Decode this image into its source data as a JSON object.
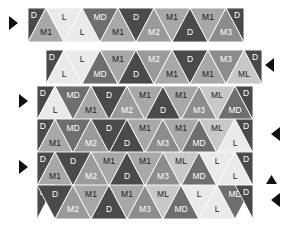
{
  "figure": {
    "type": "triangular-tiling-diagram",
    "rows": 6,
    "palette": {
      "D": "#4a4a4a",
      "MD": "#6e6e6e",
      "M1": "#a8a8a8",
      "M2": "#9a9a9a",
      "M3": "#8c8c8c",
      "ML": "#c8c8c8",
      "L": "#eaeaea"
    },
    "label_dark_on": [
      "D",
      "MD",
      "M3",
      "M2"
    ],
    "marker_color": "#111111"
  },
  "rows": [
    {
      "id": "row-1",
      "x": 28,
      "y": 8,
      "tri_w": 36,
      "tri_h": 34,
      "lead_half": "D",
      "tail_half": "D",
      "tiles": [
        {
          "label": "M1",
          "shade": "M1",
          "dir": "up"
        },
        {
          "label": "L",
          "shade": "L",
          "dir": "down"
        },
        {
          "label": "L",
          "shade": "L",
          "dir": "up"
        },
        {
          "label": "MD",
          "shade": "MD",
          "dir": "down"
        },
        {
          "label": "M1",
          "shade": "M1",
          "dir": "up"
        },
        {
          "label": "D",
          "shade": "D",
          "dir": "down"
        },
        {
          "label": "M2",
          "shade": "M2",
          "dir": "up"
        },
        {
          "label": "M1",
          "shade": "M1",
          "dir": "down"
        },
        {
          "label": "D",
          "shade": "D",
          "dir": "up"
        },
        {
          "label": "M1",
          "shade": "M1",
          "dir": "down"
        },
        {
          "label": "M3",
          "shade": "M3",
          "dir": "up"
        }
      ]
    },
    {
      "id": "row-2",
      "x": 46,
      "y": 50,
      "tri_w": 36,
      "tri_h": 34,
      "lead_half": "D",
      "tail_half": "D",
      "tiles": [
        {
          "label": "L",
          "shade": "L",
          "dir": "up"
        },
        {
          "label": "L",
          "shade": "L",
          "dir": "down"
        },
        {
          "label": "MD",
          "shade": "MD",
          "dir": "up"
        },
        {
          "label": "M1",
          "shade": "M1",
          "dir": "down"
        },
        {
          "label": "D",
          "shade": "D",
          "dir": "up"
        },
        {
          "label": "M2",
          "shade": "M2",
          "dir": "down"
        },
        {
          "label": "M1",
          "shade": "M1",
          "dir": "up"
        },
        {
          "label": "D",
          "shade": "D",
          "dir": "down"
        },
        {
          "label": "M1",
          "shade": "M1",
          "dir": "up"
        },
        {
          "label": "M3",
          "shade": "M3",
          "dir": "down"
        },
        {
          "label": "ML",
          "shade": "ML",
          "dir": "up"
        }
      ]
    },
    {
      "id": "row-3",
      "x": 37,
      "y": 86,
      "tri_w": 36,
      "tri_h": 34,
      "lead_half": "D",
      "tail_half": "D",
      "tiles": [
        {
          "label": "L",
          "shade": "L",
          "dir": "up"
        },
        {
          "label": "MD",
          "shade": "MD",
          "dir": "down"
        },
        {
          "label": "M1",
          "shade": "M1",
          "dir": "up"
        },
        {
          "label": "D",
          "shade": "D",
          "dir": "down"
        },
        {
          "label": "M2",
          "shade": "M2",
          "dir": "up"
        },
        {
          "label": "M1",
          "shade": "M1",
          "dir": "down"
        },
        {
          "label": "D",
          "shade": "D",
          "dir": "up"
        },
        {
          "label": "M1",
          "shade": "M1",
          "dir": "down"
        },
        {
          "label": "M3",
          "shade": "M3",
          "dir": "up"
        },
        {
          "label": "ML",
          "shade": "ML",
          "dir": "down"
        },
        {
          "label": "MD",
          "shade": "MD",
          "dir": "up"
        }
      ]
    },
    {
      "id": "row-4",
      "x": 37,
      "y": 119,
      "tri_w": 36,
      "tri_h": 34,
      "lead_half": "D",
      "tail_half": "D",
      "tiles": [
        {
          "label": "M1",
          "shade": "M1",
          "dir": "up"
        },
        {
          "label": "MD",
          "shade": "MD",
          "dir": "down"
        },
        {
          "label": "M2",
          "shade": "M2",
          "dir": "up"
        },
        {
          "label": "D",
          "shade": "D",
          "dir": "down"
        },
        {
          "label": "D",
          "shade": "D",
          "dir": "up"
        },
        {
          "label": "M1",
          "shade": "M1",
          "dir": "down"
        },
        {
          "label": "M3",
          "shade": "M3",
          "dir": "up"
        },
        {
          "label": "M1",
          "shade": "M1",
          "dir": "down"
        },
        {
          "label": "MD",
          "shade": "MD",
          "dir": "up"
        },
        {
          "label": "ML",
          "shade": "ML",
          "dir": "down"
        },
        {
          "label": "L",
          "shade": "L",
          "dir": "up"
        }
      ]
    },
    {
      "id": "row-5",
      "x": 37,
      "y": 152,
      "tri_w": 36,
      "tri_h": 34,
      "lead_half": "D",
      "tail_half": "D",
      "tiles": [
        {
          "label": "M1",
          "shade": "M1",
          "dir": "up"
        },
        {
          "label": "D",
          "shade": "D",
          "dir": "down"
        },
        {
          "label": "M2",
          "shade": "M2",
          "dir": "up"
        },
        {
          "label": "M1",
          "shade": "M1",
          "dir": "down"
        },
        {
          "label": "D",
          "shade": "D",
          "dir": "up"
        },
        {
          "label": "M1",
          "shade": "M1",
          "dir": "down"
        },
        {
          "label": "M3",
          "shade": "M3",
          "dir": "up"
        },
        {
          "label": "ML",
          "shade": "ML",
          "dir": "down"
        },
        {
          "label": "MD",
          "shade": "MD",
          "dir": "up"
        },
        {
          "label": "L",
          "shade": "L",
          "dir": "down"
        },
        {
          "label": "L",
          "shade": "L",
          "dir": "up"
        }
      ]
    },
    {
      "id": "row-6",
      "x": 37,
      "y": 185,
      "tri_w": 36,
      "tri_h": 34,
      "lead_half": "D",
      "tail_half": "D",
      "tiles": [
        {
          "label": "D",
          "shade": "D",
          "dir": "down"
        },
        {
          "label": "M2",
          "shade": "M2",
          "dir": "up"
        },
        {
          "label": "M1",
          "shade": "M1",
          "dir": "down"
        },
        {
          "label": "D",
          "shade": "D",
          "dir": "up"
        },
        {
          "label": "M1",
          "shade": "M1",
          "dir": "down"
        },
        {
          "label": "M3",
          "shade": "M3",
          "dir": "up"
        },
        {
          "label": "ML",
          "shade": "ML",
          "dir": "down"
        },
        {
          "label": "MD",
          "shade": "MD",
          "dir": "up"
        },
        {
          "label": "L",
          "shade": "L",
          "dir": "down"
        },
        {
          "label": "L",
          "shade": "L",
          "dir": "up"
        },
        {
          "label": "MD",
          "shade": "MD",
          "dir": "down"
        }
      ]
    }
  ],
  "markers": [
    {
      "id": "marker-left-row1",
      "glyph": "right-triangle",
      "x": 8,
      "y": 16
    },
    {
      "id": "marker-left-row3",
      "glyph": "right-triangle",
      "x": 18,
      "y": 94
    },
    {
      "id": "marker-left-row5",
      "glyph": "right-triangle",
      "x": 18,
      "y": 160
    },
    {
      "id": "marker-right-row2",
      "glyph": "left-triangle",
      "x": 264,
      "y": 58
    },
    {
      "id": "marker-right-row4",
      "glyph": "left-triangle",
      "x": 270,
      "y": 127
    },
    {
      "id": "marker-up-row5",
      "glyph": "up-triangle",
      "x": 266,
      "y": 173
    },
    {
      "id": "marker-right-row6",
      "glyph": "left-triangle",
      "x": 270,
      "y": 193
    }
  ]
}
